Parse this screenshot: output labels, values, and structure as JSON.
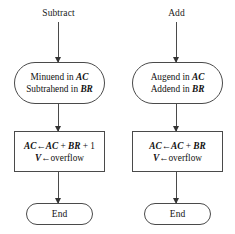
{
  "diagram": {
    "stroke_color": "#4a4a4a",
    "text_color": "#111111",
    "background": "#ffffff",
    "columns": [
      {
        "id": "subtract",
        "caption": "Subtract",
        "operand_box": {
          "line1_prefix": "Minuend in ",
          "line1_reg": "AC",
          "line2_prefix": "Subtrahend in ",
          "line2_reg": "BR"
        },
        "action_box": {
          "line1_dest": "AC",
          "line1_arrow": "←",
          "line1_src1": "AC",
          "line1_plus1": " + ",
          "line1_src2": "BR",
          "line1_plus2": " + 1",
          "line2_dest": "V",
          "line2_arrow": "←",
          "line2_src": "overflow"
        },
        "terminator": "End"
      },
      {
        "id": "add",
        "caption": "Add",
        "operand_box": {
          "line1_prefix": "Augend in ",
          "line1_reg": "AC",
          "line2_prefix": "Addend in ",
          "line2_reg": "BR"
        },
        "action_box": {
          "line1_dest": "AC",
          "line1_arrow": "←",
          "line1_src1": "AC",
          "line1_plus1": " + ",
          "line1_src2": "BR",
          "line1_plus2": "",
          "line2_dest": "V",
          "line2_arrow": "←",
          "line2_src": "overflow"
        },
        "terminator": "End"
      }
    ]
  }
}
